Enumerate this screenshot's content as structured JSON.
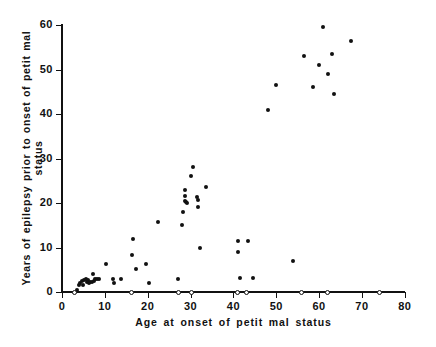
{
  "chart_data": {
    "type": "scatter",
    "title": "",
    "xlabel": "Age at onset of petit mal status",
    "ylabel": "Years of epilepsy prior to onset of petit mal status",
    "xlim": [
      0,
      80
    ],
    "ylim": [
      0,
      62
    ],
    "xticks": [
      0,
      10,
      20,
      30,
      40,
      50,
      60,
      70,
      80
    ],
    "yticks": [
      0,
      10,
      20,
      30,
      40,
      50,
      60
    ],
    "grid": false,
    "legend": false,
    "series": [
      {
        "name": "filled",
        "marker": "filled-circle",
        "color": "#111111",
        "points": [
          [
            3.5,
            0.5
          ],
          [
            4.0,
            1.5
          ],
          [
            4.3,
            2.0
          ],
          [
            4.6,
            2.4
          ],
          [
            5.0,
            1.6
          ],
          [
            5.2,
            2.6
          ],
          [
            5.5,
            3.0
          ],
          [
            5.8,
            2.2
          ],
          [
            6.0,
            2.6
          ],
          [
            6.3,
            2.0
          ],
          [
            6.6,
            2.3
          ],
          [
            6.9,
            2.2
          ],
          [
            7.2,
            4.0
          ],
          [
            7.5,
            2.5
          ],
          [
            7.8,
            3.0
          ],
          [
            8.2,
            3.0
          ],
          [
            8.6,
            2.9
          ],
          [
            10.3,
            6.2
          ],
          [
            12.0,
            3.0
          ],
          [
            12.2,
            2.0
          ],
          [
            13.7,
            3.0
          ],
          [
            16.3,
            8.4
          ],
          [
            16.6,
            12.0
          ],
          [
            17.2,
            5.2
          ],
          [
            19.6,
            6.2
          ],
          [
            20.2,
            2.0
          ],
          [
            22.3,
            15.8
          ],
          [
            27.0,
            3.0
          ],
          [
            28.0,
            15.0
          ],
          [
            28.3,
            18.0
          ],
          [
            28.6,
            23.0
          ],
          [
            28.6,
            21.5
          ],
          [
            28.8,
            20.5
          ],
          [
            29.0,
            20.3
          ],
          [
            29.2,
            20.0
          ],
          [
            30.0,
            26.0
          ],
          [
            30.5,
            28.0
          ],
          [
            31.6,
            21.3
          ],
          [
            31.7,
            20.6
          ],
          [
            31.8,
            19.0
          ],
          [
            32.2,
            10.0
          ],
          [
            33.5,
            23.5
          ],
          [
            41.0,
            11.5
          ],
          [
            41.0,
            9.0
          ],
          [
            43.5,
            11.5
          ],
          [
            41.5,
            3.2
          ],
          [
            44.5,
            3.2
          ],
          [
            48.0,
            41.0
          ],
          [
            50.0,
            46.5
          ],
          [
            54.0,
            7.0
          ],
          [
            56.5,
            53.0
          ],
          [
            58.5,
            46.0
          ],
          [
            60.0,
            51.0
          ],
          [
            61.0,
            59.5
          ],
          [
            62.0,
            49.0
          ],
          [
            63.0,
            53.5
          ],
          [
            63.5,
            44.5
          ],
          [
            67.5,
            56.5
          ]
        ]
      },
      {
        "name": "zero-years",
        "marker": "open-circle",
        "color": "#111111",
        "points": [
          [
            3.0,
            0
          ],
          [
            16.3,
            0
          ],
          [
            27.2,
            0
          ],
          [
            30.2,
            0
          ],
          [
            41.0,
            0
          ],
          [
            43.0,
            0
          ],
          [
            56.0,
            0
          ],
          [
            62.0,
            0
          ],
          [
            74.0,
            0
          ]
        ]
      }
    ]
  },
  "axes": {
    "x_title": "Age at onset of petit mal status",
    "y_title": "Years of epilepsy prior to onset of petit mal status",
    "x_tick_labels": [
      "0",
      "10",
      "20",
      "30",
      "40",
      "50",
      "60",
      "70",
      "80"
    ],
    "y_tick_labels": [
      "0",
      "10",
      "20",
      "30",
      "40",
      "50",
      "60"
    ],
    "axis_color": "#111111"
  }
}
